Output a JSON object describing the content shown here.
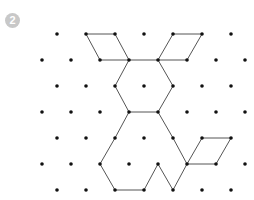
{
  "badge": {
    "label": "2",
    "color": "#c8c8c8"
  },
  "grid": {
    "odd_row_y": [
      34,
      86,
      138,
      190
    ],
    "odd_row_x": [
      57,
      86,
      115,
      144,
      173,
      202,
      231
    ],
    "even_row_y": [
      60,
      112,
      164
    ],
    "even_row_x": [
      42,
      71,
      100,
      129,
      158,
      187,
      216,
      245
    ],
    "dot_color": "#111111",
    "dot_radius": 1.8
  },
  "shape": {
    "stroke": "#555555",
    "polylines": [
      [
        [
          86,
          34
        ],
        [
          115,
          34
        ],
        [
          129,
          60
        ],
        [
          100,
          60
        ],
        [
          86,
          34
        ]
      ],
      [
        [
          173,
          34
        ],
        [
          202,
          34
        ],
        [
          187,
          60
        ],
        [
          158,
          60
        ],
        [
          173,
          34
        ]
      ],
      [
        [
          129,
          60
        ],
        [
          158,
          60
        ]
      ],
      [
        [
          129,
          60
        ],
        [
          115,
          86
        ],
        [
          129,
          112
        ],
        [
          158,
          112
        ],
        [
          173,
          86
        ],
        [
          158,
          60
        ]
      ],
      [
        [
          129,
          112
        ],
        [
          115,
          138
        ],
        [
          100,
          164
        ],
        [
          115,
          190
        ],
        [
          144,
          190
        ],
        [
          158,
          164
        ],
        [
          173,
          190
        ],
        [
          187,
          164
        ]
      ],
      [
        [
          158,
          112
        ],
        [
          173,
          138
        ],
        [
          187,
          164
        ]
      ],
      [
        [
          187,
          164
        ],
        [
          202,
          138
        ],
        [
          231,
          138
        ],
        [
          216,
          164
        ],
        [
          187,
          164
        ]
      ]
    ]
  }
}
